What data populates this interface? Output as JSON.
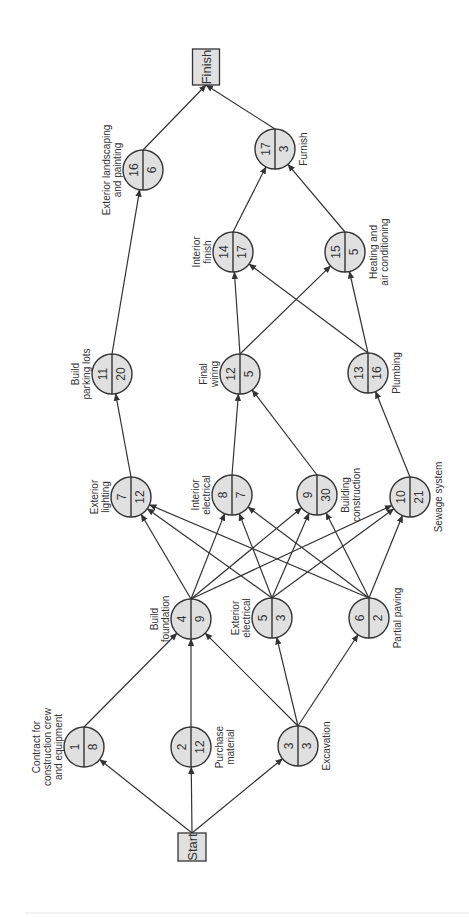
{
  "diagram": {
    "type": "activity-on-node project network",
    "orientation": "rotated 90 degrees counter-clockwise (flows bottom to top)",
    "colors": {
      "node_fill": "#e0e0e0",
      "stroke": "#333333",
      "text": "#333333",
      "background": "#ffffff"
    },
    "terminals": [
      {
        "id": "start",
        "label": "Start",
        "x": 192,
        "y": 847,
        "w": 28,
        "h": 28
      },
      {
        "id": "finish",
        "label": "Finish",
        "x": 206,
        "y": 67,
        "w": 27,
        "h": 36
      }
    ],
    "nodes": [
      {
        "id": "1",
        "activity": "1",
        "duration": "8",
        "label": [
          "Contract for",
          "construction crew",
          "and equipment"
        ],
        "x": 84,
        "y": 747,
        "label_side": "left"
      },
      {
        "id": "2",
        "activity": "2",
        "duration": "12",
        "label": [
          "Purchase",
          "material"
        ],
        "x": 191,
        "y": 747,
        "label_side": "right"
      },
      {
        "id": "3",
        "activity": "3",
        "duration": "3",
        "label": [
          "Excavation"
        ],
        "x": 298,
        "y": 746,
        "label_side": "right"
      },
      {
        "id": "4",
        "activity": "4",
        "duration": "9",
        "label": [
          "Build",
          "foundation"
        ],
        "x": 191,
        "y": 619,
        "label_side": "left"
      },
      {
        "id": "5",
        "activity": "5",
        "duration": "3",
        "label": [
          "Exterior",
          "electrical"
        ],
        "x": 272,
        "y": 618,
        "label_side": "left"
      },
      {
        "id": "6",
        "activity": "6",
        "duration": "2",
        "label": [
          "Partial paving"
        ],
        "x": 369,
        "y": 618,
        "label_side": "right"
      },
      {
        "id": "7",
        "activity": "7",
        "duration": "12",
        "label": [
          "Exterior",
          "lighting"
        ],
        "x": 131,
        "y": 497,
        "label_side": "left"
      },
      {
        "id": "8",
        "activity": "8",
        "duration": "7",
        "label": [
          "Interior",
          "electrical"
        ],
        "x": 232,
        "y": 495,
        "label_side": "left"
      },
      {
        "id": "9",
        "activity": "9",
        "duration": "30",
        "label": [
          "Building",
          "construction"
        ],
        "x": 317,
        "y": 495,
        "label_side": "right"
      },
      {
        "id": "10",
        "activity": "10",
        "duration": "21",
        "label": [
          "Sewage system"
        ],
        "x": 410,
        "y": 497,
        "label_side": "right"
      },
      {
        "id": "11",
        "activity": "11",
        "duration": "20",
        "label": [
          "Build",
          "parking lots"
        ],
        "x": 112,
        "y": 374,
        "label_side": "left"
      },
      {
        "id": "12",
        "activity": "12",
        "duration": "5",
        "label": [
          "Final",
          "wiring"
        ],
        "x": 240,
        "y": 374,
        "label_side": "left"
      },
      {
        "id": "13",
        "activity": "13",
        "duration": "16",
        "label": [
          "Plumbing"
        ],
        "x": 368,
        "y": 373,
        "label_side": "right"
      },
      {
        "id": "14",
        "activity": "14",
        "duration": "17",
        "label": [
          "Interior",
          "finish"
        ],
        "x": 233,
        "y": 252,
        "label_side": "left"
      },
      {
        "id": "15",
        "activity": "15",
        "duration": "5",
        "label": [
          "Heating and",
          "air conditioning"
        ],
        "x": 345,
        "y": 252,
        "label_side": "right"
      },
      {
        "id": "16",
        "activity": "16",
        "duration": "6",
        "label": [
          "Exterior landscaping",
          "and painting"
        ],
        "x": 143,
        "y": 170,
        "label_side": "left"
      },
      {
        "id": "17",
        "activity": "17",
        "duration": "3",
        "label": [
          "Furnish"
        ],
        "x": 275,
        "y": 149,
        "label_side": "right"
      }
    ],
    "edges": [
      {
        "from": "start",
        "to": "1"
      },
      {
        "from": "start",
        "to": "2"
      },
      {
        "from": "start",
        "to": "3"
      },
      {
        "from": "1",
        "to": "4"
      },
      {
        "from": "2",
        "to": "4"
      },
      {
        "from": "3",
        "to": "4"
      },
      {
        "from": "3",
        "to": "5"
      },
      {
        "from": "3",
        "to": "6"
      },
      {
        "from": "4",
        "to": "7"
      },
      {
        "from": "4",
        "to": "8"
      },
      {
        "from": "4",
        "to": "9"
      },
      {
        "from": "4",
        "to": "10"
      },
      {
        "from": "5",
        "to": "7"
      },
      {
        "from": "5",
        "to": "8"
      },
      {
        "from": "5",
        "to": "9"
      },
      {
        "from": "5",
        "to": "10"
      },
      {
        "from": "6",
        "to": "7"
      },
      {
        "from": "6",
        "to": "8"
      },
      {
        "from": "6",
        "to": "9"
      },
      {
        "from": "6",
        "to": "10"
      },
      {
        "from": "7",
        "to": "11"
      },
      {
        "from": "8",
        "to": "12"
      },
      {
        "from": "9",
        "to": "12"
      },
      {
        "from": "10",
        "to": "13"
      },
      {
        "from": "11",
        "to": "16"
      },
      {
        "from": "12",
        "to": "14"
      },
      {
        "from": "12",
        "to": "15"
      },
      {
        "from": "13",
        "to": "14"
      },
      {
        "from": "13",
        "to": "15"
      },
      {
        "from": "14",
        "to": "17"
      },
      {
        "from": "15",
        "to": "17"
      },
      {
        "from": "16",
        "to": "finish"
      },
      {
        "from": "17",
        "to": "finish"
      }
    ],
    "node_radius": 20
  }
}
